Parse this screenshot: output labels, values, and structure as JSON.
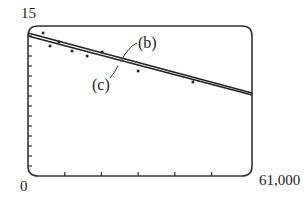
{
  "chart_data": {
    "type": "scatter",
    "title": "",
    "xlabel": "",
    "ylabel": "",
    "xlim": [
      0,
      61000
    ],
    "ylim": [
      0,
      15
    ],
    "tick_labels": {
      "y_max": "15",
      "origin": "0",
      "x_max": "61,000"
    },
    "x_ticks": [
      10000,
      20000,
      30000,
      40000,
      50000,
      60000
    ],
    "y_ticks": [
      1,
      2,
      3,
      4,
      5,
      6,
      7,
      8,
      9,
      10,
      11,
      12,
      13,
      14
    ],
    "grid": false,
    "points": [
      {
        "x": 4100,
        "y": 14.3
      },
      {
        "x": 6000,
        "y": 13.0
      },
      {
        "x": 8400,
        "y": 13.4
      },
      {
        "x": 12000,
        "y": 12.5
      },
      {
        "x": 16100,
        "y": 12.0
      },
      {
        "x": 20200,
        "y": 12.4
      },
      {
        "x": 30000,
        "y": 10.5
      },
      {
        "x": 44900,
        "y": 9.4
      }
    ],
    "series": [
      {
        "name": "(b)",
        "type": "line",
        "x": [
          0,
          61000
        ],
        "y": [
          14.3,
          8.3
        ]
      },
      {
        "name": "(c)",
        "type": "line",
        "x": [
          0,
          61000
        ],
        "y": [
          14.0,
          8.1
        ]
      }
    ],
    "annotations": [
      {
        "text": "(b)",
        "points_to": "upper regression line"
      },
      {
        "text": "(c)",
        "points_to": "lower regression line"
      }
    ]
  }
}
